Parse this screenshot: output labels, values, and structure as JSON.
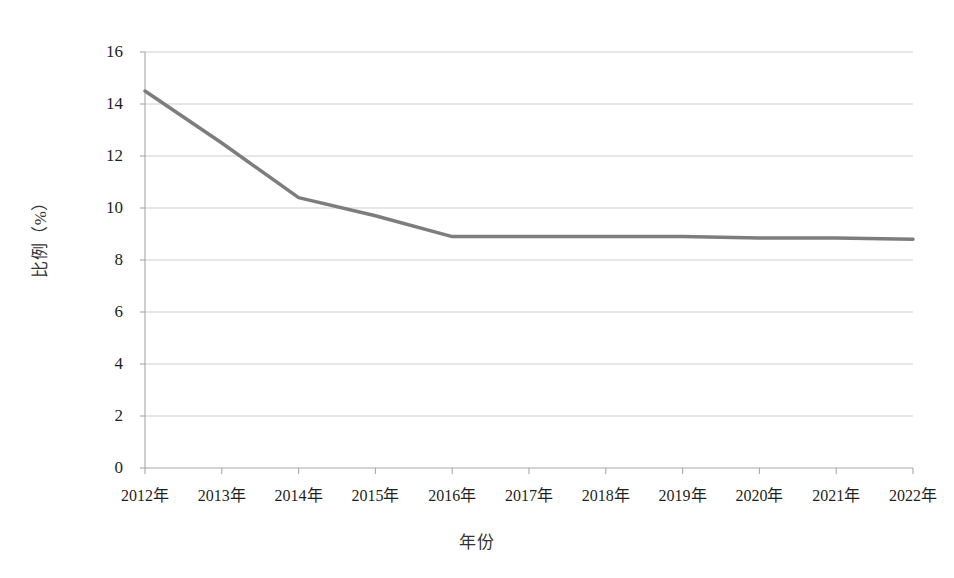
{
  "chart_data": {
    "type": "line",
    "title": "",
    "subtitle": "",
    "xlabel": "年份",
    "ylabel": "比例（%）",
    "categories": [
      "2012年",
      "2013年",
      "2014年",
      "2015年",
      "2016年",
      "2017年",
      "2018年",
      "2019年",
      "2020年",
      "2021年",
      "2022年"
    ],
    "x_values": [
      2012,
      2013,
      2014,
      2015,
      2016,
      2017,
      2018,
      2019,
      2020,
      2021,
      2022
    ],
    "series": [
      {
        "name": "比例",
        "values": [
          14.5,
          12.5,
          10.4,
          9.7,
          8.9,
          8.9,
          8.9,
          8.9,
          8.85,
          8.85,
          8.8
        ],
        "color": "#7d7d7d",
        "marker": "none",
        "line_width": 3.5
      }
    ],
    "ylim": [
      0,
      16
    ],
    "y_ticks": [
      0,
      2,
      4,
      6,
      8,
      10,
      12,
      14,
      16
    ],
    "y_tick_labels": [
      "0",
      "2",
      "4",
      "6",
      "8",
      "10",
      "12",
      "14",
      "16"
    ],
    "xlim": [
      2012,
      2022
    ],
    "grid": {
      "horizontal": true,
      "vertical": false,
      "color": "#c9c9c9"
    },
    "legend": {
      "visible": false,
      "position": "none"
    },
    "axis_color": "#a8a8a8",
    "background": "#ffffff"
  },
  "figure": {
    "plot_left_px": 145,
    "plot_right_px": 913,
    "plot_top_px": 52,
    "plot_bottom_px": 468
  }
}
